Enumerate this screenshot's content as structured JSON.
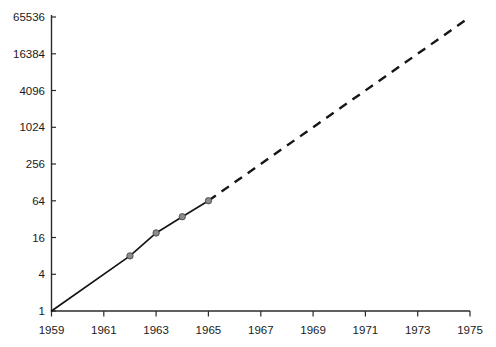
{
  "chart_data": {
    "type": "line",
    "title": "",
    "subtitle": "",
    "xlabel": "",
    "ylabel": "",
    "yscale": "log",
    "log_base": 4,
    "xlim": [
      1959,
      1975
    ],
    "ylim": [
      1,
      65536
    ],
    "grid": false,
    "legend": "none",
    "x_tick_labels": [
      "1959",
      "1961",
      "1963",
      "1965",
      "1967",
      "1969",
      "1971",
      "1973",
      "1975"
    ],
    "x_tick_values": [
      1959,
      1961,
      1963,
      1965,
      1967,
      1969,
      1971,
      1973,
      1975
    ],
    "y_tick_labels": [
      "1",
      "4",
      "16",
      "64",
      "256",
      "1024",
      "4096",
      "16384",
      "65536"
    ],
    "y_tick_values": [
      1,
      4,
      16,
      64,
      256,
      1024,
      4096,
      16384,
      65536
    ],
    "series": [
      {
        "name": "observed",
        "style": "solid",
        "marker": "circle",
        "x": [
          1959,
          1962,
          1963,
          1964,
          1965
        ],
        "values": [
          1,
          8,
          19,
          35,
          64
        ]
      },
      {
        "name": "extrapolated",
        "style": "dashed",
        "marker": "none",
        "x": [
          1965,
          1975
        ],
        "values": [
          64,
          65536
        ]
      }
    ],
    "annotations": []
  },
  "axes": {
    "y_axis_name": "y-axis",
    "x_axis_name": "x-axis"
  }
}
